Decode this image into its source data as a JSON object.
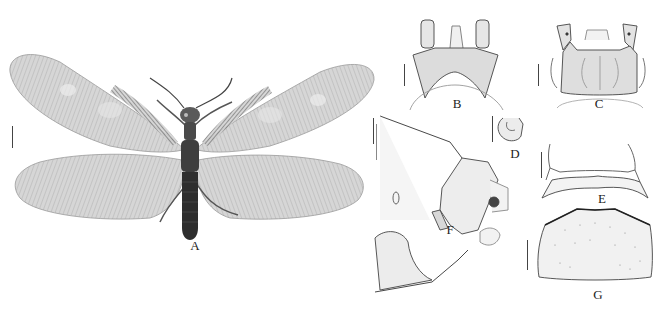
{
  "figure": {
    "type": "taxonomic plate",
    "panels": [
      {
        "id": "A",
        "label": "A",
        "content": "habitus photograph, dorsal view, wings spread"
      },
      {
        "id": "B",
        "label": "B",
        "content": "terminalia line drawing, dorsal view"
      },
      {
        "id": "C",
        "label": "C",
        "content": "terminalia line drawing, ventral view"
      },
      {
        "id": "D",
        "label": "D",
        "content": "sclerite, small line drawing"
      },
      {
        "id": "E",
        "label": "E",
        "content": "sclerite with lateral horns, line drawing"
      },
      {
        "id": "F",
        "label": "F",
        "content": "abdominal apex, lateral view, line drawing"
      },
      {
        "id": "G",
        "label": "G",
        "content": "plate with setose margin, line drawing"
      }
    ],
    "scale_bars": [
      "A-left",
      "A-right",
      "B",
      "C",
      "D",
      "E",
      "F",
      "G"
    ],
    "colors": {
      "background": "#ffffff",
      "wing_fill": "#d4d4d4",
      "wing_vein": "#8a8a8a",
      "body": "#3a3a3a",
      "line_art": "#444444",
      "label": "#222222"
    }
  }
}
